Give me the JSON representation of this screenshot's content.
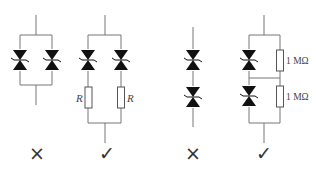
{
  "figure": {
    "type": "circuit-comparison",
    "circuits": [
      {
        "id": "parallel-without-resistors",
        "topology": "parallel",
        "components": [
          "TVS diode",
          "TVS diode"
        ],
        "verdict_mark": "×",
        "verdict": "incorrect"
      },
      {
        "id": "parallel-with-resistors",
        "topology": "parallel",
        "components": [
          "TVS diode + R",
          "TVS diode + R"
        ],
        "resistor_labels": [
          "R",
          "R"
        ],
        "verdict_mark": "✓",
        "verdict": "correct"
      },
      {
        "id": "series-without-resistors",
        "topology": "series",
        "components": [
          "TVS diode",
          "TVS diode"
        ],
        "verdict_mark": "×",
        "verdict": "incorrect"
      },
      {
        "id": "series-with-balancing-resistors",
        "topology": "series",
        "components": [
          "TVS diode || 1 MΩ",
          "TVS diode || 1 MΩ"
        ],
        "resistor_labels": [
          "1 MΩ",
          "1 MΩ"
        ],
        "verdict_mark": "✓",
        "verdict": "correct"
      }
    ]
  },
  "colors": {
    "wire": "#777777",
    "diode": "#111111",
    "text": "#333333"
  }
}
